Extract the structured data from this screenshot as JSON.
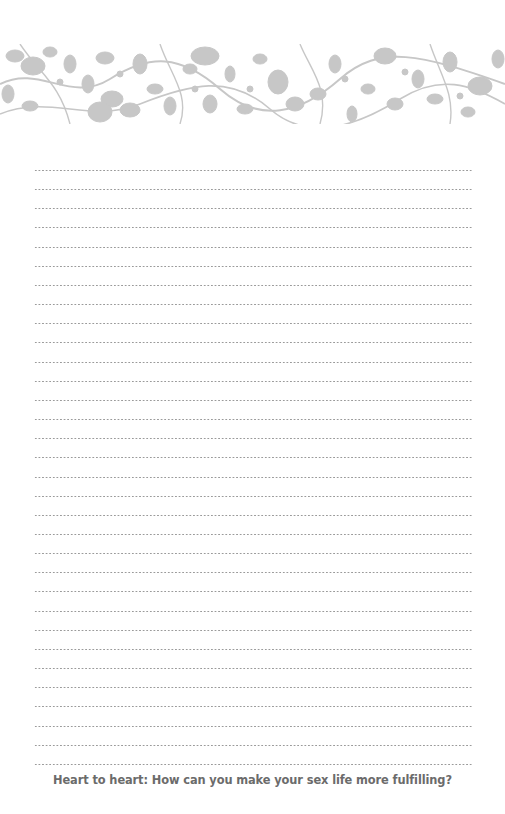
{
  "page": {
    "banner": {
      "name": "floral-vine-border",
      "color": "#c4c4c4"
    },
    "writing_lines": {
      "count": 32,
      "style": "dotted",
      "color": "#9a9a9a"
    },
    "prompt": "Heart to heart: How can you make your sex life more fulfilling?"
  }
}
